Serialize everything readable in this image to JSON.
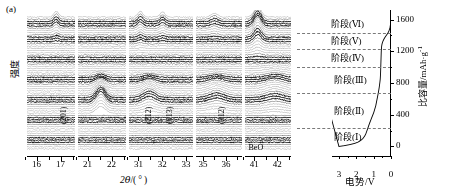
{
  "figure": {
    "panel_label": "(a)",
    "type": "operando-xrd-waterfall-with-electrochemical-curve"
  },
  "xrd": {
    "ylabel": "强度",
    "xlabel": "2θ/(°)",
    "segments": [
      {
        "id": "seg1",
        "range": [
          15.6,
          17.6
        ],
        "ticks": [
          16,
          17
        ],
        "minor": [
          15.5,
          16.5,
          17.5
        ]
      },
      {
        "id": "seg2",
        "range": [
          20.6,
          22.6
        ],
        "ticks": [
          21,
          22
        ],
        "minor": [
          20.5,
          21.5,
          22.5
        ]
      },
      {
        "id": "seg3",
        "range": [
          30.6,
          33.3
        ],
        "ticks": [
          31,
          32,
          33
        ],
        "minor": [
          30.5,
          31.5,
          32.5
        ]
      },
      {
        "id": "seg4",
        "range": [
          34.7,
          36.7
        ],
        "ticks": [
          35,
          36
        ],
        "minor": [
          35.5,
          36.5
        ]
      },
      {
        "id": "seg5",
        "range": [
          40.6,
          42.6
        ],
        "ticks": [
          41,
          42
        ],
        "minor": [
          40.5,
          41.5,
          42.5
        ]
      }
    ],
    "peak_labels": [
      {
        "text": "(201)",
        "segment": "seg1",
        "two_theta": 16.8,
        "orientation": "vertical"
      },
      {
        "text": "(212)",
        "segment": "seg3",
        "two_theta": 31.1,
        "orientation": "vertical"
      },
      {
        "text": "(013)",
        "segment": "seg3",
        "two_theta": 32.0,
        "orientation": "vertical"
      },
      {
        "text": "(312)",
        "segment": "seg4",
        "two_theta": 35.5,
        "orientation": "vertical"
      },
      {
        "text": "BeO",
        "segment": "seg5",
        "two_theta": 41.1,
        "orientation": "horizontal"
      }
    ],
    "scan_count": 60
  },
  "electrochem": {
    "xlabel": "电势/V",
    "x_ticks": [
      3,
      2,
      1,
      0
    ],
    "x_range": [
      3.4,
      0
    ],
    "ylabel": "比容量/mAh·g",
    "ylabel_exponent": "-1",
    "y_ticks": [
      0,
      400,
      800,
      1200,
      1600
    ],
    "y_range": [
      -120,
      1720
    ],
    "stages": [
      {
        "label": "阶段(Ⅰ)",
        "boundary_capacity": 230
      },
      {
        "label": "阶段(Ⅱ)",
        "boundary_capacity": 680
      },
      {
        "label": "阶段(Ⅲ)",
        "boundary_capacity": 1000
      },
      {
        "label": "阶段(Ⅳ)",
        "boundary_capacity": 1230
      },
      {
        "label": "阶段(Ⅴ)",
        "boundary_capacity": 1430
      },
      {
        "label": "阶段(Ⅵ)",
        "boundary_capacity": null
      }
    ]
  },
  "chart_data": {
    "type": "line",
    "title": "",
    "xlabel": "电势/V",
    "ylabel": "比容量/mAh·g-1",
    "xlim": [
      3.4,
      0.0
    ],
    "ylim": [
      -120,
      1720
    ],
    "grid": false,
    "legend": "none",
    "series": [
      {
        "name": "放电曲线 (电势 vs 比容量)",
        "x": [
          3.0,
          2.7,
          2.4,
          2.1,
          1.9,
          1.75,
          1.62,
          1.52,
          1.45,
          1.4,
          1.36,
          1.32,
          1.28,
          1.24,
          1.2,
          1.16,
          1.12,
          1.08,
          1.04,
          1.0,
          0.97,
          0.94,
          0.91,
          0.88,
          0.86,
          0.84,
          0.82,
          0.8,
          0.78,
          0.76,
          0.74,
          0.72,
          0.7,
          0.68,
          0.66,
          0.64,
          0.62,
          0.61,
          0.6,
          0.595,
          0.59,
          0.585,
          0.58,
          0.575,
          0.57,
          0.565,
          0.56,
          0.55,
          0.54,
          0.52,
          0.49,
          0.45,
          0.4,
          0.34,
          0.27,
          0.19,
          0.12,
          0.06,
          0.02,
          0.0
        ],
        "y": [
          0,
          10,
          22,
          38,
          55,
          75,
          100,
          130,
          160,
          190,
          215,
          240,
          265,
          290,
          312,
          335,
          358,
          380,
          402,
          424,
          446,
          468,
          490,
          512,
          534,
          556,
          578,
          600,
          622,
          644,
          666,
          690,
          716,
          744,
          775,
          810,
          850,
          890,
          930,
          965,
          1000,
          1035,
          1070,
          1105,
          1140,
          1175,
          1205,
          1235,
          1262,
          1288,
          1312,
          1334,
          1356,
          1378,
          1400,
          1425,
          1455,
          1495,
          1550,
          1620
        ]
      }
    ],
    "annotations": [
      {
        "text": "阶段(Ⅰ)",
        "capacity": 120
      },
      {
        "text": "阶段(Ⅱ)",
        "capacity": 450
      },
      {
        "text": "阶段(Ⅲ)",
        "capacity": 840
      },
      {
        "text": "阶段(Ⅳ)",
        "capacity": 1110
      },
      {
        "text": "阶段(Ⅴ)",
        "capacity": 1330
      },
      {
        "text": "阶段(Ⅵ)",
        "capacity": 1540
      }
    ],
    "stage_dividers": [
      230,
      680,
      1000,
      1230,
      1430
    ]
  }
}
